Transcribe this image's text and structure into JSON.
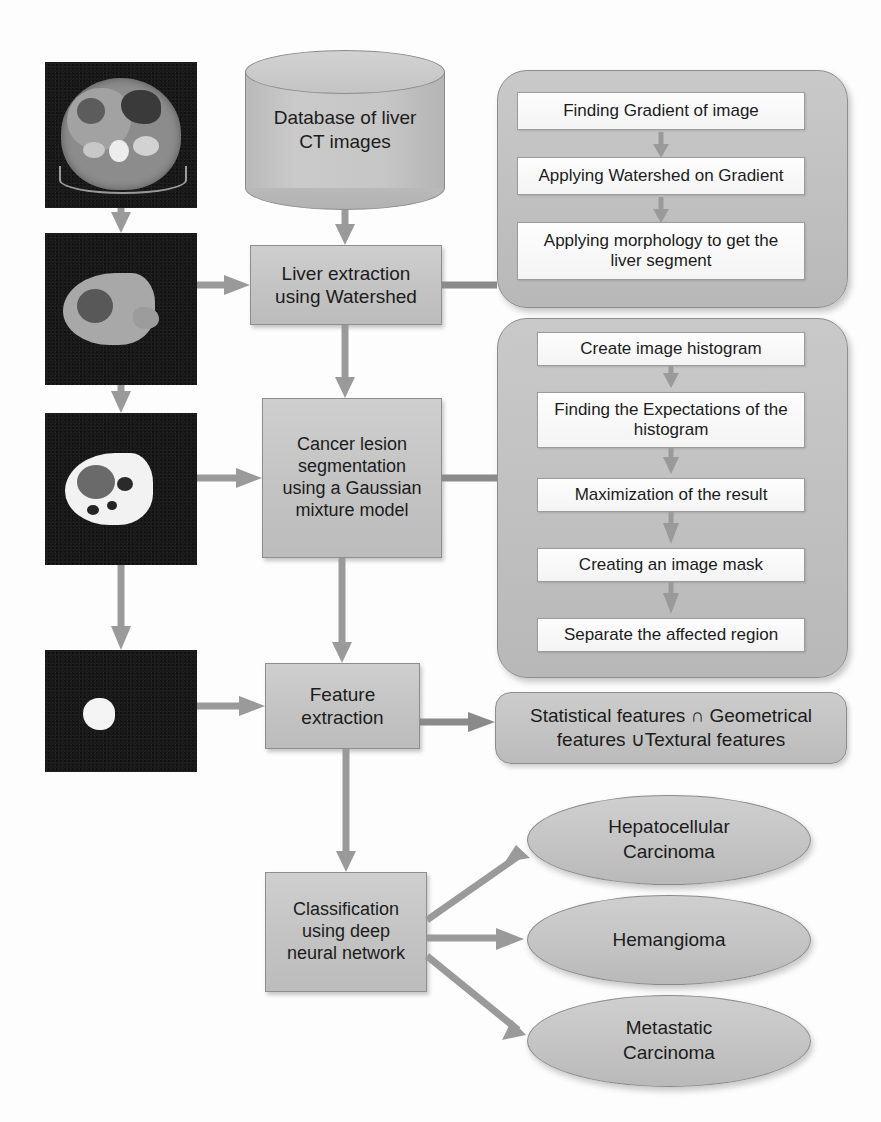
{
  "diagram": {
    "colors": {
      "node_fill": "#c4c4c4",
      "group_fill": "#bfbfbf",
      "step_fill": "#fafafa",
      "border": "#8d8d8d",
      "arrow": "#9a9a9a",
      "image_bg": "#1a1a1a",
      "text": "#1c1c1c",
      "page_bg": "#fdfdfd"
    },
    "images": [
      {
        "name": "abdominal-ct-slice",
        "caption": ""
      },
      {
        "name": "extracted-liver-segment",
        "caption": ""
      },
      {
        "name": "segmented-lesion-mask",
        "caption": ""
      },
      {
        "name": "isolated-lesion-region",
        "caption": ""
      }
    ],
    "database": {
      "label": "Database of liver\nCT images"
    },
    "stages": [
      {
        "id": "liver-extraction",
        "label": "Liver extraction\nusing Watershed"
      },
      {
        "id": "cancer-segmentation",
        "label": "Cancer lesion\nsegmentation\nusing a Gaussian\nmixture model"
      },
      {
        "id": "feature-extraction",
        "label": "Feature\nextraction"
      },
      {
        "id": "classification",
        "label": "Classification\nusing deep\nneural network"
      }
    ],
    "watershed_group": {
      "name": "watershed-steps-group",
      "steps": [
        "Finding Gradient of image",
        "Applying Watershed on Gradient",
        "Applying morphology to get the\nliver segment"
      ]
    },
    "gmm_group": {
      "name": "gmm-steps-group",
      "steps": [
        "Create image histogram",
        "Finding the Expectations of the\nhistogram",
        "Maximization of the result",
        "Creating an image mask",
        "Separate the affected region"
      ]
    },
    "feature_result": {
      "label": "Statistical features ∩ Geometrical\nfeatures ∪Textural features"
    },
    "classes": [
      {
        "id": "hepatocellular-carcinoma",
        "label": "Hepatocellular\nCarcinoma"
      },
      {
        "id": "hemangioma",
        "label": "Hemangioma"
      },
      {
        "id": "metastatic-carcinoma",
        "label": "Metastatic\nCarcinoma"
      }
    ]
  }
}
